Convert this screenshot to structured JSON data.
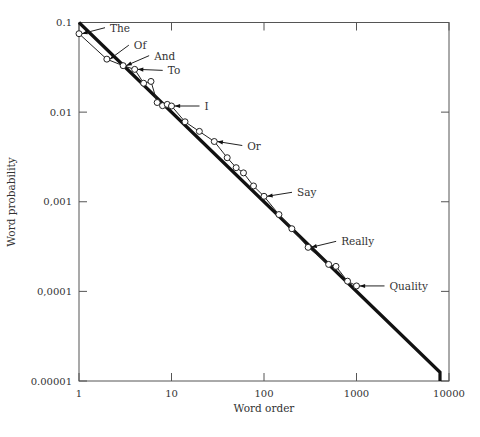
{
  "chart_data": {
    "type": "line",
    "title": "",
    "xlabel": "Word order",
    "ylabel": "Word probability",
    "xscale": "log",
    "yscale": "log",
    "xlim": [
      1,
      10000
    ],
    "ylim": [
      1e-05,
      0.1
    ],
    "grid": false,
    "legend": null,
    "x_ticks": [
      {
        "value": 1,
        "label": "1"
      },
      {
        "value": 10,
        "label": "10"
      },
      {
        "value": 100,
        "label": "100"
      },
      {
        "value": 1000,
        "label": "1000"
      },
      {
        "value": 10000,
        "label": "10000"
      }
    ],
    "y_ticks": [
      {
        "value": 0.1,
        "label": "0.1"
      },
      {
        "value": 0.01,
        "label": "0.01"
      },
      {
        "value": 0.001,
        "label": "0,001"
      },
      {
        "value": 0.0001,
        "label": "0,0001"
      },
      {
        "value": 1e-05,
        "label": "0.00001"
      }
    ],
    "series": [
      {
        "name": "Zipf law fit",
        "style": "thick-line",
        "x": [
          1,
          8000,
          8000
        ],
        "y": [
          0.1,
          1.25e-05,
          1e-05
        ]
      },
      {
        "name": "Observed word frequencies",
        "style": "line-with-open-circles",
        "x": [
          1,
          2,
          3,
          4,
          5,
          6,
          7,
          8,
          9,
          10,
          14,
          20,
          29,
          40,
          50,
          60,
          77,
          100,
          145,
          200,
          300,
          500,
          600,
          800,
          1000
        ],
        "y": [
          0.075,
          0.039,
          0.033,
          0.03,
          0.021,
          0.022,
          0.0128,
          0.0118,
          0.0122,
          0.0117,
          0.0078,
          0.0061,
          0.0047,
          0.0031,
          0.0024,
          0.0021,
          0.0015,
          0.00115,
          0.00072,
          0.0005,
          0.00031,
          0.0002,
          0.00019,
          0.00013,
          0.000115
        ]
      }
    ],
    "annotations": [
      {
        "label": "The",
        "x": 1,
        "y": 0.075
      },
      {
        "label": "Of",
        "x": 2,
        "y": 0.039
      },
      {
        "label": "And",
        "x": 3,
        "y": 0.033
      },
      {
        "label": "To",
        "x": 4,
        "y": 0.03
      },
      {
        "label": "I",
        "x": 10,
        "y": 0.0117
      },
      {
        "label": "Or",
        "x": 29,
        "y": 0.0047
      },
      {
        "label": "Say",
        "x": 100,
        "y": 0.00115
      },
      {
        "label": "Really",
        "x": 300,
        "y": 0.00031
      },
      {
        "label": "Quality",
        "x": 1000,
        "y": 0.000115
      }
    ]
  },
  "labels": {
    "xlabel": "Word order",
    "ylabel": "Word probability"
  }
}
